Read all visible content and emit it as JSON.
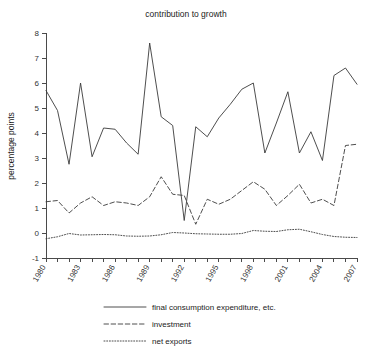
{
  "chart_data": {
    "type": "line",
    "title": "contribution to growth",
    "xlabel": "",
    "ylabel": "percentage points",
    "ylim": [
      -1,
      8
    ],
    "yticks": [
      -1,
      0,
      1,
      2,
      3,
      4,
      5,
      6,
      7,
      8
    ],
    "ytick_labels": [
      "-1",
      "0",
      "1",
      "2",
      "3",
      "4",
      "5",
      "6",
      "7",
      "8"
    ],
    "xlim": [
      1980,
      2007
    ],
    "x": [
      1980,
      1981,
      1982,
      1983,
      1984,
      1985,
      1986,
      1987,
      1988,
      1989,
      1990,
      1991,
      1992,
      1993,
      1994,
      1995,
      1996,
      1997,
      1998,
      1999,
      2000,
      2001,
      2002,
      2003,
      2004,
      2005,
      2006,
      2007
    ],
    "xtick_labels": [
      "1980",
      "1983",
      "1986",
      "1989",
      "1992",
      "1995",
      "1998",
      "2001",
      "2004",
      "2007"
    ],
    "xticks_labeled": [
      1980,
      1983,
      1986,
      1989,
      1992,
      1995,
      1998,
      2001,
      2004,
      2007
    ],
    "grid": false,
    "legend_position": "below-axes",
    "series": [
      {
        "name": "final consumption expenditure, etc.",
        "style": "solid",
        "values": [
          5.7,
          4.9,
          2.75,
          6.0,
          3.05,
          4.2,
          4.15,
          3.6,
          3.15,
          7.6,
          4.65,
          4.3,
          0.5,
          4.25,
          3.85,
          4.6,
          5.15,
          5.75,
          6.0,
          3.2,
          4.4,
          5.65,
          3.2,
          4.05,
          2.9,
          6.3,
          5.85,
          6.25
        ]
      },
      {
        "name": "investment",
        "style": "dashed",
        "values": [
          1.25,
          1.3,
          0.8,
          1.2,
          1.45,
          1.1,
          1.25,
          1.2,
          1.1,
          1.45,
          2.25,
          1.55,
          1.5,
          0.35,
          1.35,
          1.15,
          1.35,
          1.7,
          2.05,
          1.75,
          1.1,
          1.5,
          1.95,
          1.2,
          1.35,
          1.1,
          2.35,
          3.1
        ]
      },
      {
        "name": "net exports",
        "style": "dotted",
        "values": [
          -0.23,
          -0.15,
          -0.02,
          -0.08,
          -0.07,
          -0.06,
          -0.07,
          -0.12,
          -0.13,
          -0.12,
          -0.07,
          0.02,
          0.0,
          -0.03,
          -0.04,
          -0.05,
          -0.05,
          -0.02,
          0.1,
          0.07,
          0.06,
          0.13,
          0.15,
          0.05,
          -0.06,
          -0.14,
          -0.17,
          -0.18
        ]
      }
    ],
    "series_tail": {
      "note": "final consumption 2006-2007 continues to 6.6 then 5.95; investment ends near 3.55",
      "final_consumption_2006": 6.6,
      "final_consumption_2007": 5.95,
      "investment_2006": 3.5,
      "investment_2007": 3.55
    }
  },
  "legend": {
    "items": [
      {
        "label": "final consumption expenditure, etc.",
        "style": "solid"
      },
      {
        "label": "investment",
        "style": "dashed"
      },
      {
        "label": "net exports",
        "style": "dotted"
      }
    ]
  },
  "colors": {
    "line": "#3a3a3a",
    "axis": "#4a4a4a",
    "text": "#222222",
    "background": "#ffffff"
  }
}
